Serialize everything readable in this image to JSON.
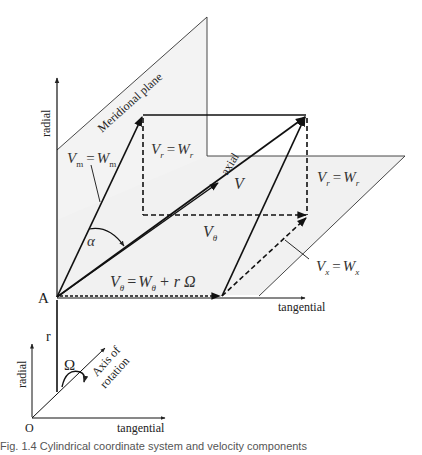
{
  "diagram": {
    "planes": {
      "meridional_label": "Meridional plane"
    },
    "axes": {
      "radial_top": "radial",
      "axial": "axial",
      "tangential_main": "tangential",
      "radial_bottom": "radial",
      "tangential_bottom": "tangential",
      "axis_of_rotation_line1": "Axis of",
      "axis_of_rotation_line2": "rotation"
    },
    "points": {
      "A": "A",
      "O": "O",
      "r": "r"
    },
    "symbols": {
      "omega": "Ω",
      "alpha": "α"
    },
    "equations": {
      "vm": {
        "lhs": "V",
        "lhs_sub": "m",
        "rhs": "W",
        "rhs_sub": "m"
      },
      "vr_left": {
        "lhs": "V",
        "lhs_sub": "r",
        "rhs": "W",
        "rhs_sub": "r"
      },
      "vr_right": {
        "lhs": "V",
        "lhs_sub": "r",
        "rhs": "W",
        "rhs_sub": "r"
      },
      "vx": {
        "lhs": "V",
        "lhs_sub": "x",
        "rhs": "W",
        "rhs_sub": "x"
      },
      "vtheta": {
        "lhs": "V",
        "lhs_sub": "θ",
        "rhs": "W",
        "rhs_sub": "θ",
        "extra": "+ r Ω"
      },
      "v": "V",
      "vtheta_label": {
        "base": "V",
        "sub": "θ"
      }
    },
    "equals": "="
  },
  "caption": "Fig. 1.4  Cylindrical coordinate system and velocity components"
}
